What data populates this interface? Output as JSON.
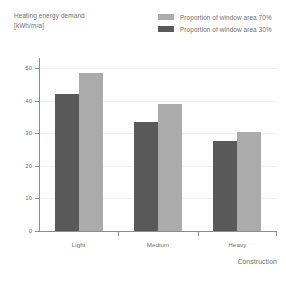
{
  "chart_data": {
    "type": "bar",
    "title": "",
    "subtitle": "",
    "ylabel_line1": "Heating energy demand",
    "ylabel_line2": "[kWh/m²a]",
    "xlabel": "Construction",
    "categories": [
      "Light",
      "Medium",
      "Heavy"
    ],
    "series": [
      {
        "name": "Proportion of window area 30%",
        "color": "#595959",
        "values": [
          42,
          33.5,
          27.5
        ]
      },
      {
        "name": "Proportion of window area 70%",
        "color": "#ababab",
        "values": [
          48.5,
          39,
          30.5
        ]
      }
    ],
    "ylim": [
      0,
      50
    ],
    "yticks": [
      0,
      10,
      20,
      30,
      40,
      50
    ],
    "ytick_labels": [
      "0",
      "10",
      "20",
      "30",
      "40",
      "50"
    ],
    "grid": true,
    "grid_color": "#f1f1f1",
    "axis_color": "#8c8c8c",
    "legend_position": "top-right",
    "legend_order": [
      "Proportion of window area 70%",
      "Proportion of window area 30%"
    ]
  }
}
